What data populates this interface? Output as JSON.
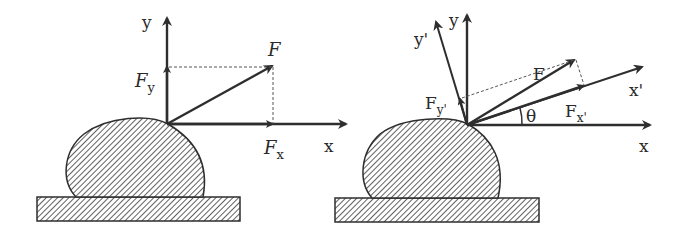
{
  "diagram": {
    "colors": {
      "line": "#2e2e2e",
      "dashed": "#555555",
      "background": "#ffffff"
    },
    "left_panel": {
      "labels": {
        "axis_y": "y",
        "axis_x": "x",
        "force": "F",
        "force_y_main": "F",
        "force_y_sub": "y",
        "force_x_main": "F",
        "force_x_sub": "x"
      }
    },
    "right_panel": {
      "labels": {
        "axis_y": "y",
        "axis_x": "x",
        "axis_y_prime": "y'",
        "axis_x_prime": "x'",
        "force": "F",
        "force_yp_main": "F",
        "force_yp_sub": "y'",
        "force_xp_main": "F",
        "force_xp_sub": "x'",
        "angle": "θ"
      }
    }
  }
}
